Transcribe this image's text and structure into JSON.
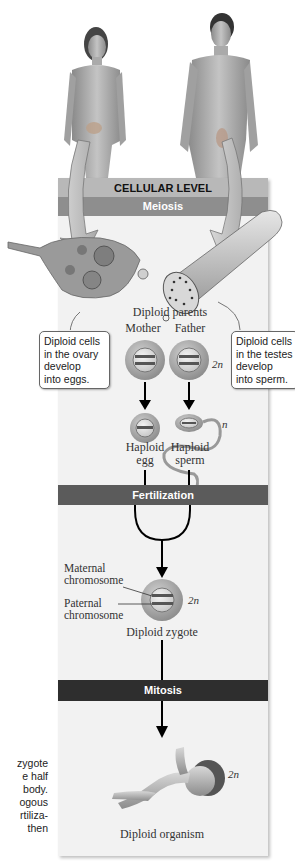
{
  "figure": {
    "level_label": "CELLULAR LEVEL",
    "stages": {
      "meiosis": "Meiosis",
      "fertilization": "Fertilization",
      "mitosis": "Mitosis"
    },
    "callouts": {
      "ovary": "Diploid cells in the ovary develop into eggs.",
      "ovary_lines": [
        "Diploid cells",
        "in the ovary",
        "develop",
        "into eggs."
      ],
      "testes": "Diploid cells in the testes develop into sperm.",
      "testes_lines": [
        "Diploid cells",
        "in the testes",
        "develop",
        "into sperm."
      ]
    },
    "parents": {
      "title": "Diploid parents",
      "mother": "Mother",
      "father": "Father",
      "ploidy": "2n"
    },
    "gametes": {
      "egg_line1": "Haploid",
      "egg_line2": "egg",
      "sperm_line1": "Haploid",
      "sperm_line2": "sperm",
      "ploidy": "n"
    },
    "zygote": {
      "maternal_line1": "Maternal",
      "maternal_line2": "chromosome",
      "paternal_line1": "Paternal",
      "paternal_line2": "chromosome",
      "ploidy": "2n",
      "label": "Diploid zygote"
    },
    "organism": {
      "ploidy": "2n",
      "label": "Diploid organism"
    },
    "side_text_fragment": [
      "zygote",
      "e half",
      "body.",
      "ogous",
      "rtiliza-",
      "then"
    ],
    "colors": {
      "cellular_banner": "#b8b8b8",
      "meiosis_banner": "#8e8e8e",
      "fertilization_banner": "#5b5b5b",
      "mitosis_banner": "#2e2e2e",
      "panel_bg": "#f2f2f2"
    }
  }
}
